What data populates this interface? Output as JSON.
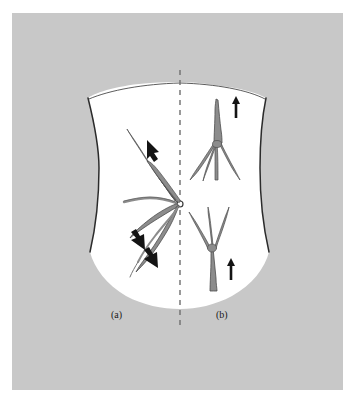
{
  "figure": {
    "panel_background_color": "#c8c8c8",
    "page_background_color": "#ffffff",
    "body_fill_color": "#ffffff",
    "vein_fill_color": "#8c8c8c",
    "vein_outline_color": "#4d4d4d",
    "arrow_color": "#141414",
    "midline_color": "#6e6e6e",
    "outline_color": "#2b2b2b",
    "captions": [
      {
        "id": "caption-a",
        "label": "(a)"
      },
      {
        "id": "caption-b",
        "label": "(b)"
      }
    ],
    "panels": {
      "a": {
        "label": "(a)",
        "side": "left",
        "pattern_name": "caput-medusae-radiating-from-umbilicus",
        "flow_description": "flow radiating away from umbilicus",
        "vessel_count": 5,
        "arrow_count": 3,
        "arrow_directions": [
          "up-left",
          "down-left",
          "down-left"
        ]
      },
      "b": {
        "label": "(b)",
        "side": "right",
        "pattern_name": "upward-flow-inferior-vena-cava-obstruction",
        "flow_description": "flow directed upward in both upper and lower vessels",
        "vessel_count": 2,
        "arrow_count": 2,
        "arrow_directions": [
          "up",
          "up"
        ]
      }
    },
    "midline": {
      "name": "midline-dashed-axis",
      "style": "dashed",
      "dash_pattern": "5 5"
    },
    "umbilicus": {
      "name": "umbilicus-marker",
      "shape": "small-circle",
      "x": 180,
      "y": 204,
      "radius": 3
    }
  }
}
